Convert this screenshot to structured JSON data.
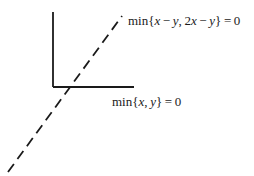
{
  "figure": {
    "name": "piecewise-linear-cone-diagram",
    "background_color": "#ffffff",
    "stroke_color": "#1a1a1a",
    "width": 254,
    "height": 176
  },
  "geometry": {
    "origin": {
      "x": 53,
      "y": 87
    },
    "vertical_ray": {
      "x1": 53,
      "y1": 12,
      "x2": 53,
      "y2": 87,
      "style": "solid"
    },
    "horizontal_ray": {
      "x1": 53,
      "y1": 87,
      "x2": 134,
      "y2": 87,
      "style": "solid"
    },
    "diagonal_line": {
      "x1": 8,
      "y1": 172,
      "x2": 122,
      "y2": 16,
      "style": "dashed",
      "dash": "10 6"
    }
  },
  "labels": {
    "upper": {
      "name": "min-x-minus-y-2x-minus-y-equals-zero",
      "fn": "min",
      "open_brace": "{",
      "term1_var1": "x",
      "term1_op": "−",
      "term1_var2": "y",
      "separator": ",",
      "term2_coeff": "2",
      "term2_var1": "x",
      "term2_op": "−",
      "term2_var2": "y",
      "close_brace": "}",
      "equals": "=",
      "value": "0"
    },
    "lower": {
      "name": "min-x-y-equals-zero",
      "fn": "min",
      "open_brace": "{",
      "var1": "x",
      "separator": ",",
      "var2": "y",
      "close_brace": "}",
      "equals": "=",
      "value": "0"
    }
  }
}
